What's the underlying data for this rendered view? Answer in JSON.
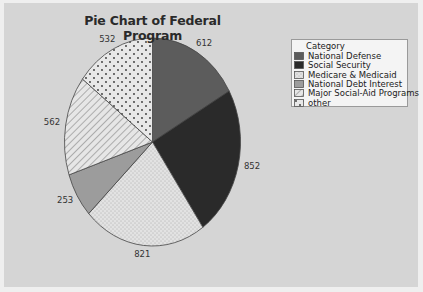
{
  "chart_data": {
    "type": "pie",
    "title": "Pie Chart of Federal Program",
    "legend_title": "Category",
    "legend_position": "right",
    "categories": [
      "National Defense",
      "Social Security",
      "Medicare & Medicaid",
      "National Debt Interest",
      "Major Social-Aid Programs",
      "other"
    ],
    "values": [
      612,
      852,
      821,
      253,
      562,
      532
    ],
    "labels": [
      "612",
      "852",
      "821",
      "253",
      "562",
      "532"
    ],
    "start_angle": "12 o'clock, clockwise",
    "fills": [
      "#5c5c5c",
      "#2a2a2a",
      "dots-fine-light",
      "#9c9c9c",
      "diagonal-hatch",
      "dots-coarse"
    ]
  },
  "colors": {
    "background": "#d5d5d5",
    "frame": "#efefef",
    "legend_bg": "#f4f4f4"
  }
}
